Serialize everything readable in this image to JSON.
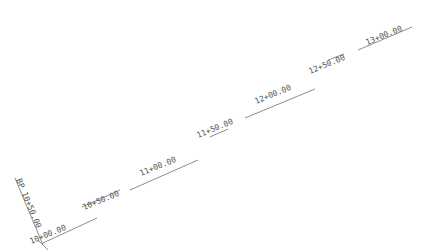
{
  "drawing": {
    "line_color": "#6e6e6e",
    "text_color": "#555555",
    "bp_label": "BP 10+50.00",
    "stations": [
      {
        "label": "10+00.00"
      },
      {
        "label": "10+50.00"
      },
      {
        "label": "11+00.00"
      },
      {
        "label": "11+50.00"
      },
      {
        "label": "12+00.00"
      },
      {
        "label": "12+50.00"
      },
      {
        "label": "13+00.00"
      }
    ]
  }
}
